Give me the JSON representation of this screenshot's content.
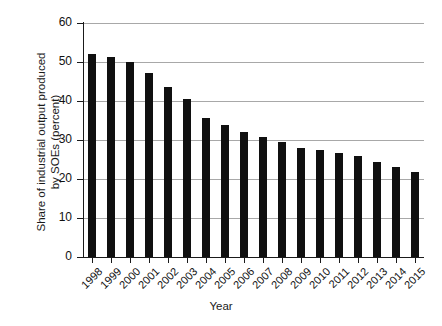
{
  "chart_data": {
    "type": "bar",
    "title": "",
    "xlabel": "Year",
    "ylabel": "Share of industrial output produced\nby SOEs (percent)",
    "categories": [
      "1998",
      "1999",
      "2000",
      "2001",
      "2002",
      "2003",
      "2004",
      "2005",
      "2006",
      "2007",
      "2008",
      "2009",
      "2010",
      "2011",
      "2012",
      "2013",
      "2014",
      "2015"
    ],
    "values": [
      52.0,
      51.2,
      50.0,
      47.3,
      43.5,
      40.4,
      35.6,
      33.9,
      32.1,
      30.8,
      29.4,
      28.0,
      27.5,
      26.7,
      25.9,
      24.4,
      23.0,
      21.7
    ],
    "ylim": [
      0,
      60
    ],
    "yticks": [
      0,
      10,
      20,
      30,
      40,
      50,
      60
    ],
    "ytick_labels": [
      "0",
      "10",
      "20",
      "30",
      "40",
      "50",
      "60"
    ],
    "grid": true,
    "grid_axis": "y",
    "legend": "none",
    "bar_color": "#101010",
    "grid_color": "#a8a8a8",
    "axis_color": "#1a1a1a",
    "background": "#ffffff"
  }
}
